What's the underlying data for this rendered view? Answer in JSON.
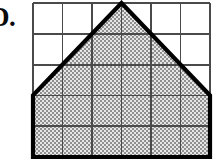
{
  "label": {
    "text": "D.",
    "note": "clipped at left edge"
  },
  "colors": {
    "ink": "#111111",
    "grid_line": "#4a4a4a",
    "outline": "#000000",
    "shade_dark": "#8c8c8c",
    "shade_light": "#e3e3e3",
    "background": "#ffffff"
  },
  "figure": {
    "name": "shaded-pentagon-on-grid",
    "grid": {
      "columns": 6,
      "rows": 5,
      "cell_width": 29.5,
      "cell_height": 30.8,
      "x_lines": [
        33,
        62.5,
        92,
        121.5,
        151,
        180.5,
        210
      ],
      "y_lines": [
        3,
        33.8,
        64.6,
        95.4,
        126.2,
        157
      ],
      "stroke_width": 1.8
    },
    "outline": {
      "stroke_width": 4.2,
      "points": "33,157 33,95.4 121.5,3 210,95.4 210,157"
    },
    "vertices": [
      {
        "name": "bottom-left",
        "x": 33,
        "y": 157
      },
      {
        "name": "mid-left",
        "x": 33,
        "y": 95.4
      },
      {
        "name": "apex",
        "x": 121.5,
        "y": 3
      },
      {
        "name": "mid-right",
        "x": 210,
        "y": 95.4
      },
      {
        "name": "bottom-right",
        "x": 210,
        "y": 157
      }
    ],
    "shade_pattern": {
      "type": "checkerboard-dither",
      "tile": 2
    }
  }
}
